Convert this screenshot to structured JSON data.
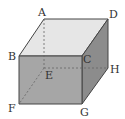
{
  "diagram": {
    "vertices": {
      "A": {
        "label": "A"
      },
      "B": {
        "label": "B"
      },
      "C": {
        "label": "C"
      },
      "D": {
        "label": "D"
      },
      "E": {
        "label": "E"
      },
      "F": {
        "label": "F"
      },
      "G": {
        "label": "G"
      },
      "H": {
        "label": "H"
      }
    },
    "colors": {
      "top_face": "#e6e6e6",
      "front_face": "#a6a6a6",
      "right_face": "#8c8c8c",
      "edge": "#444444",
      "hidden_edge": "#666666"
    }
  }
}
